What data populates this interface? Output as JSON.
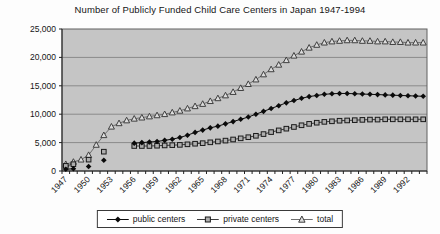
{
  "page": {
    "background": "#fdfdfd"
  },
  "chart_data": {
    "type": "line",
    "title": "Number of Publicly Funded Child Care Centers in Japan 1947-1994",
    "xlabel": "",
    "ylabel": "",
    "ylim": [
      0,
      25000
    ],
    "y_tick_step": 5000,
    "y_tick_labels": [
      "0",
      "5,000",
      "10,000",
      "15,000",
      "20,000",
      "25,000"
    ],
    "x_label_every": 3,
    "x_tick_labels": [
      "1947",
      "1950",
      "1953",
      "1956",
      "1959",
      "1962",
      "1965",
      "1968",
      "1971",
      "1974",
      "1977",
      "1980",
      "1983",
      "1986",
      "1989",
      "1992"
    ],
    "grid": true,
    "plot_background": "#c5c5c5",
    "gridline_color": "#8a8a8a",
    "legend_position": "bottom-center",
    "x": [
      1947,
      1948,
      1949,
      1950,
      1951,
      1952,
      1953,
      1954,
      1955,
      1956,
      1957,
      1958,
      1959,
      1960,
      1961,
      1962,
      1963,
      1964,
      1965,
      1966,
      1967,
      1968,
      1969,
      1970,
      1971,
      1972,
      1973,
      1974,
      1975,
      1976,
      1977,
      1978,
      1979,
      1980,
      1981,
      1982,
      1983,
      1984,
      1985,
      1986,
      1987,
      1988,
      1989,
      1990,
      1991,
      1992,
      1993,
      1994
    ],
    "series": [
      {
        "name": "public centers",
        "marker": "diamond-filled",
        "color": "#0a0a0a",
        "fill": "#0a0a0a",
        "values": [
          300,
          400,
          null,
          800,
          null,
          1900,
          null,
          null,
          null,
          4900,
          5000,
          5100,
          5200,
          5400,
          5600,
          5900,
          6300,
          6800,
          7200,
          7600,
          7900,
          8300,
          8700,
          9100,
          9500,
          10000,
          10500,
          11000,
          11500,
          12000,
          12400,
          12800,
          13100,
          13300,
          13500,
          13600,
          13650,
          13650,
          13600,
          13550,
          13500,
          13450,
          13400,
          13350,
          13300,
          13250,
          13200,
          13150
        ]
      },
      {
        "name": "private centers",
        "marker": "square-open",
        "color": "#3d3d3d",
        "fill": "#aeaeae",
        "values": [
          900,
          1200,
          null,
          2000,
          null,
          3400,
          null,
          null,
          null,
          4400,
          4400,
          4400,
          4450,
          4500,
          4550,
          4600,
          4700,
          4800,
          4900,
          5050,
          5200,
          5350,
          5550,
          5750,
          5950,
          6200,
          6500,
          6850,
          7150,
          7450,
          7750,
          8050,
          8300,
          8500,
          8650,
          8750,
          8850,
          8900,
          8950,
          9000,
          9050,
          9050,
          9100,
          9100,
          9100,
          9100,
          9100,
          9100
        ]
      },
      {
        "name": "total",
        "marker": "triangle-open",
        "color": "#6e6e6e",
        "fill": "#dcdcdc",
        "values": [
          1200,
          1600,
          2000,
          2800,
          4600,
          6300,
          7800,
          8400,
          8900,
          9200,
          9400,
          9600,
          9800,
          10000,
          10300,
          10600,
          11000,
          11400,
          11800,
          12300,
          12800,
          13300,
          13900,
          14600,
          15300,
          16100,
          17000,
          17900,
          18700,
          19500,
          20300,
          21000,
          21700,
          22200,
          22600,
          22800,
          22900,
          23000,
          23000,
          22900,
          22900,
          22800,
          22800,
          22700,
          22700,
          22600,
          22600,
          22600
        ]
      }
    ]
  }
}
